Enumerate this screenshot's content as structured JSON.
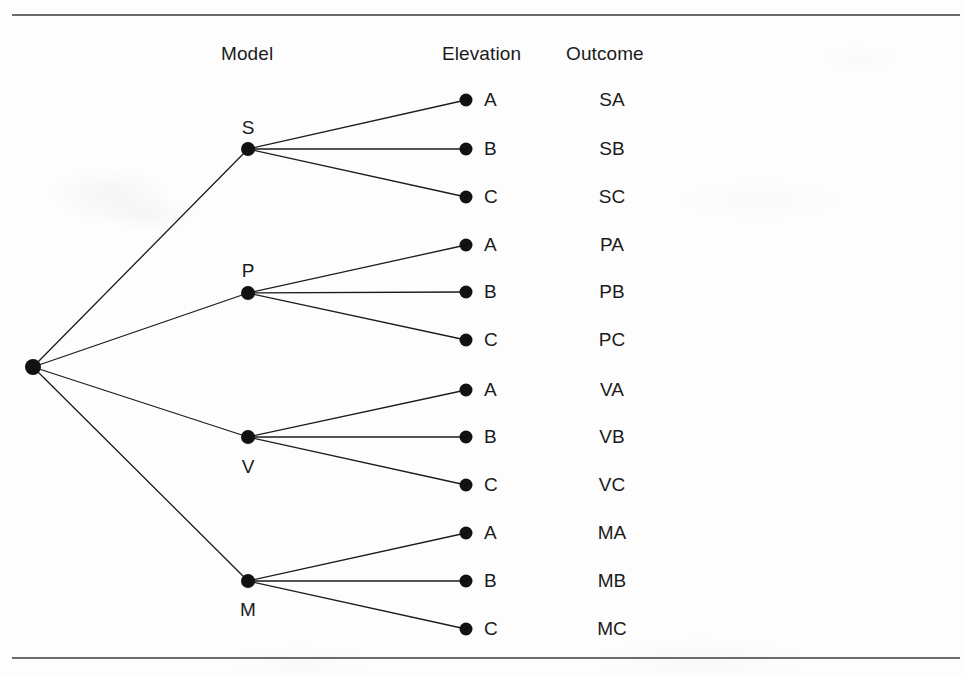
{
  "figure": {
    "type": "probability-tree-diagram",
    "background_color": "#fdfdfd",
    "ink_color": "#1b1b1b",
    "rule_color": "#4a4a4a"
  },
  "headers": {
    "model": "Model",
    "elevation": "Elevation",
    "outcome": "Outcome"
  },
  "root": {
    "label": "",
    "x": 33,
    "y": 367
  },
  "models": [
    {
      "label": "S",
      "x": 248,
      "y": 149,
      "label_position": "above",
      "label_x": 233,
      "label_y": 118,
      "elevations": [
        {
          "label": "A",
          "x": 466,
          "y": 100,
          "outcome": "SA"
        },
        {
          "label": "B",
          "x": 466,
          "y": 149,
          "outcome": "SB"
        },
        {
          "label": "C",
          "x": 466,
          "y": 197,
          "outcome": "SC"
        }
      ]
    },
    {
      "label": "P",
      "x": 248,
      "y": 293,
      "label_position": "above",
      "label_x": 233,
      "label_y": 261,
      "elevations": [
        {
          "label": "A",
          "x": 466,
          "y": 245,
          "outcome": "PA"
        },
        {
          "label": "B",
          "x": 466,
          "y": 292,
          "outcome": "PB"
        },
        {
          "label": "C",
          "x": 466,
          "y": 340,
          "outcome": "PC"
        }
      ]
    },
    {
      "label": "V",
      "x": 248,
      "y": 437,
      "label_position": "below",
      "label_x": 233,
      "label_y": 457,
      "elevations": [
        {
          "label": "A",
          "x": 466,
          "y": 390,
          "outcome": "VA"
        },
        {
          "label": "B",
          "x": 466,
          "y": 437,
          "outcome": "VB"
        },
        {
          "label": "C",
          "x": 466,
          "y": 485,
          "outcome": "VC"
        }
      ]
    },
    {
      "label": "M",
      "x": 248,
      "y": 581,
      "label_position": "below",
      "label_x": 233,
      "label_y": 600,
      "elevations": [
        {
          "label": "A",
          "x": 466,
          "y": 533,
          "outcome": "MA"
        },
        {
          "label": "B",
          "x": 466,
          "y": 581,
          "outcome": "MB"
        },
        {
          "label": "C",
          "x": 466,
          "y": 629,
          "outcome": "MC"
        }
      ]
    }
  ],
  "geometry": {
    "leaf_letter_x": 484,
    "outcome_center_x": 612,
    "node_radius_root": 8,
    "node_radius_model": 7,
    "node_radius_leaf": 6.5,
    "edge_width": 1.3,
    "rule_left": 12,
    "rule_width": 948,
    "rule_top_y": 14,
    "rule_bottom_y": 657
  }
}
